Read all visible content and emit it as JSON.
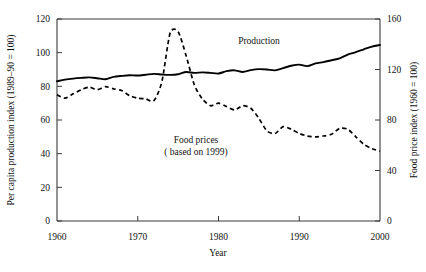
{
  "chart_data": {
    "type": "line",
    "title": "",
    "xlabel": "Year",
    "ylabel_left": "Per capita production index (1989–90 = 100)",
    "ylabel_right": "Food price index (1960 = 100)",
    "xlim": [
      1960,
      2000
    ],
    "xticks": [
      1960,
      1970,
      1980,
      1990,
      2000
    ],
    "xtick_labels": [
      "1960",
      "1970",
      "1980",
      "1990",
      "2000"
    ],
    "ylim_left": [
      0,
      120
    ],
    "yticks_left": [
      0,
      20,
      40,
      60,
      80,
      100,
      120
    ],
    "ytick_labels_left": [
      "0",
      "20",
      "40",
      "60",
      "80",
      "100",
      "120"
    ],
    "ylim_right": [
      0,
      160
    ],
    "yticks_right": [
      0,
      40,
      80,
      120,
      160
    ],
    "ytick_labels_right": [
      "0",
      "40",
      "80",
      "120",
      "160"
    ],
    "grid": false,
    "legend_position": "inline-annotation",
    "annotations": [
      {
        "name": "production-label",
        "text": "Production",
        "x": 1988.2,
        "y_left": 100.5
      },
      {
        "name": "food-prices-label",
        "line1": "Food prices",
        "line2": "( based on 1999)",
        "x": 1981.0,
        "y_left": 44.0
      }
    ],
    "series": [
      {
        "name": "Production",
        "style": "solid",
        "axis": "left",
        "units": "Per capita production index (1989-90 = 100)",
        "x": [
          1960,
          1961,
          1962,
          1963,
          1964,
          1965,
          1966,
          1967,
          1968,
          1969,
          1970,
          1971,
          1972,
          1973,
          1974,
          1975,
          1976,
          1977,
          1978,
          1979,
          1980,
          1981,
          1982,
          1983,
          1984,
          1985,
          1986,
          1987,
          1988,
          1989,
          1990,
          1991,
          1992,
          1993,
          1994,
          1995,
          1996,
          1997,
          1998,
          1999,
          2000
        ],
        "values": [
          83.0,
          84.0,
          84.6,
          85.0,
          85.3,
          84.8,
          84.2,
          85.6,
          86.2,
          86.6,
          86.4,
          86.9,
          87.4,
          87.0,
          86.8,
          87.2,
          88.5,
          88.0,
          88.3,
          88.0,
          87.6,
          89.0,
          89.5,
          88.5,
          89.6,
          90.2,
          90.0,
          89.5,
          90.8,
          92.2,
          92.9,
          92.0,
          93.6,
          94.4,
          95.5,
          96.6,
          98.9,
          100.3,
          102.0,
          103.6,
          104.6
        ]
      },
      {
        "name": "Food prices",
        "style": "dashed",
        "axis": "right",
        "units": "Food price index (1960 = 100)",
        "note": "based on 1999",
        "x": [
          1960,
          1961,
          1962,
          1963,
          1964,
          1965,
          1966,
          1967,
          1968,
          1969,
          1970,
          1971,
          1972,
          1973,
          1974,
          1975,
          1976,
          1977,
          1978,
          1979,
          1980,
          1981,
          1982,
          1983,
          1984,
          1985,
          1986,
          1987,
          1988,
          1989,
          1990,
          1991,
          1992,
          1993,
          1994,
          1995,
          1996,
          1997,
          1998,
          1999,
          2000
        ],
        "values_left_scale": [
          75.0,
          73.0,
          75.5,
          78.0,
          79.5,
          78.0,
          79.8,
          78.5,
          77.5,
          74.5,
          73.0,
          72.5,
          71.5,
          83.0,
          111.5,
          112.5,
          98.0,
          81.0,
          72.5,
          68.5,
          70.0,
          68.0,
          66.0,
          68.5,
          67.0,
          61.0,
          53.5,
          52.0,
          56.0,
          54.5,
          52.0,
          50.5,
          50.0,
          50.5,
          51.5,
          55.0,
          54.5,
          50.0,
          45.5,
          43.0,
          41.5
        ],
        "values_right_scale": [
          100.0,
          97.3,
          100.7,
          104.0,
          106.0,
          104.0,
          106.4,
          104.7,
          103.3,
          99.3,
          97.3,
          96.7,
          95.3,
          110.7,
          148.7,
          150.0,
          130.7,
          108.0,
          96.7,
          91.3,
          93.3,
          90.7,
          88.0,
          91.3,
          89.3,
          81.3,
          71.3,
          69.3,
          74.7,
          72.7,
          69.3,
          67.3,
          66.7,
          67.3,
          68.7,
          73.3,
          72.7,
          66.7,
          60.7,
          57.3,
          55.3
        ]
      }
    ]
  }
}
